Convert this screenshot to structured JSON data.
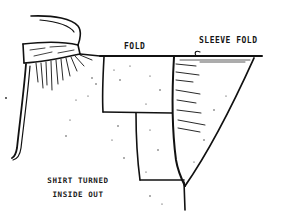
{
  "illustration": {
    "subject": "Shirt turned inside out, folded along the sleeve",
    "style": "pen-and-ink sketch",
    "ink_color": "#111111",
    "paper_color": "#ffffff"
  },
  "labels": {
    "fold": "FOLD",
    "sleeve_fold": "SLEEVE FOLD"
  },
  "caption": {
    "line1": "SHIRT TURNED",
    "line2": "INSIDE OUT"
  }
}
